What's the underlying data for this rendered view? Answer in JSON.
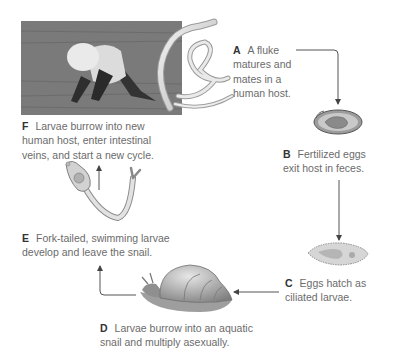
{
  "diagram": {
    "stages": [
      {
        "key": "A",
        "lines": [
          "A fluke",
          "matures and",
          "mates in a",
          "human host."
        ]
      },
      {
        "key": "B",
        "lines": [
          "Fertilized eggs",
          "exit host in feces."
        ]
      },
      {
        "key": "C",
        "lines": [
          "Eggs hatch as",
          "ciliated larvae."
        ]
      },
      {
        "key": "D",
        "lines": [
          "Larvae burrow into an aquatic",
          "snail and multiply asexually."
        ]
      },
      {
        "key": "E",
        "lines": [
          "Fork-tailed, swimming larvae",
          "develop and leave the snail."
        ]
      },
      {
        "key": "F",
        "lines": [
          "Larvae burrow into new",
          "human host, enter intestinal",
          "veins, and start a new cycle."
        ]
      }
    ],
    "images": [
      {
        "name": "rice-field-worker-photo"
      },
      {
        "name": "adult-flukes-illustration"
      },
      {
        "name": "fertilized-egg-illustration"
      },
      {
        "name": "ciliated-larva-illustration"
      },
      {
        "name": "aquatic-snail-illustration"
      },
      {
        "name": "fork-tailed-larva-illustration"
      }
    ],
    "colors": {
      "text": "#6b6b6b",
      "key": "#333333",
      "arrow": "#555555"
    }
  }
}
